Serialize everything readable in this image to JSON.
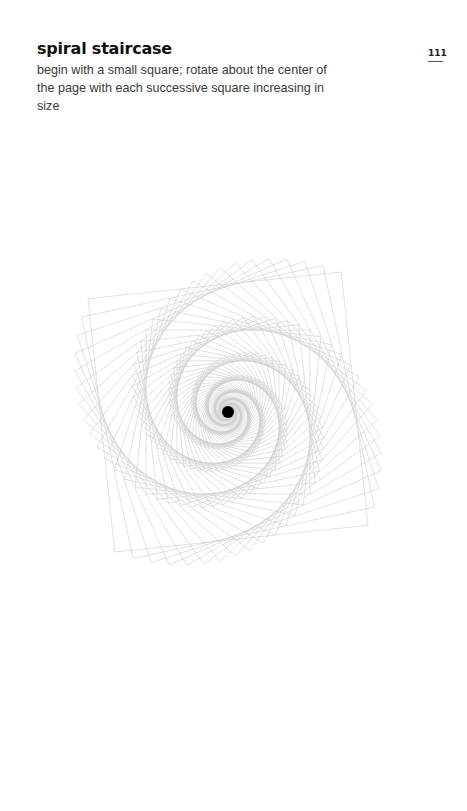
{
  "page": {
    "title": "spiral staircase",
    "description": "begin with a small square; rotate about the center of the page with each successive square increasing in size",
    "page_number": "111"
  },
  "artwork": {
    "center": [
      228,
      412
    ],
    "dot_radius": 6,
    "dot_color": "#000000",
    "line_color": "#cfcfcf",
    "square_count": 120,
    "start_half_size": 3,
    "growth_per_step": 1.032,
    "rotation_step_deg": 6
  }
}
